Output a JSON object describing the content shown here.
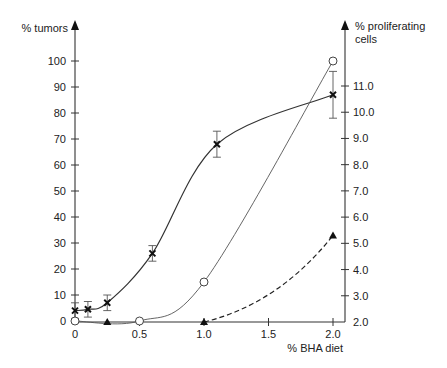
{
  "chart_data": {
    "type": "line",
    "title": "",
    "xlabel": "% BHA diet",
    "ylabel": "% tumors",
    "y2label": "% proliferating cells",
    "xlim": [
      0,
      2.0
    ],
    "ylim": [
      0,
      100
    ],
    "y2lim": [
      2.0,
      11.0
    ],
    "x_ticks": [
      "0",
      "0.5",
      "1.0",
      "1.5",
      "2.0"
    ],
    "y_ticks": [
      "0",
      "10",
      "20",
      "30",
      "40",
      "50",
      "60",
      "70",
      "80",
      "90",
      "100"
    ],
    "y2_ticks": [
      "2.0",
      "3.0",
      "4.0",
      "5.0",
      "6.0",
      "7.0",
      "8.0",
      "9.0",
      "10.0",
      "11.0"
    ],
    "grid": false,
    "legend": null,
    "series": [
      {
        "name": "proliferating cells (cross)",
        "axis": "left",
        "marker": "x",
        "line": "solid",
        "x": [
          0,
          0.1,
          0.25,
          0.6,
          1.1,
          2.0
        ],
        "y": [
          4,
          4.5,
          7,
          26,
          68,
          87
        ],
        "error": [
          3,
          3,
          3,
          3,
          5,
          9
        ]
      },
      {
        "name": "tumors (open circle)",
        "axis": "left",
        "marker": "open-circle",
        "line": "solid-thin",
        "x": [
          0,
          0.5,
          1.0,
          2.0
        ],
        "y": [
          0,
          0,
          15,
          100
        ]
      },
      {
        "name": "filled triangle",
        "axis": "right",
        "marker": "filled-triangle",
        "line": "dashed",
        "x": [
          0.25,
          1.0,
          2.0
        ],
        "y": [
          2.0,
          2.0,
          5.3
        ]
      }
    ]
  },
  "labels": {
    "y_left_title": "% tumors",
    "y_right_title_line1": "% proliferating",
    "y_right_title_line2": "cells",
    "x_title": "% BHA diet"
  }
}
